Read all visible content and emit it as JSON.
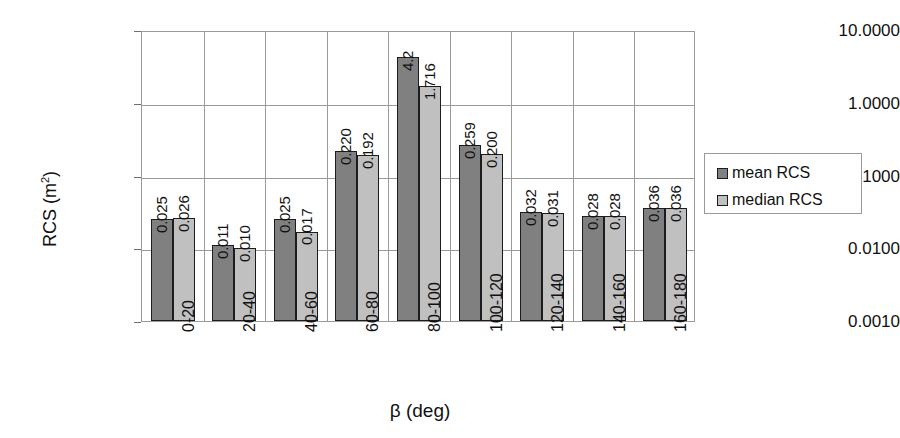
{
  "chart_data": {
    "type": "bar",
    "title": "",
    "xlabel": "β (deg)",
    "ylabel": "RCS (m²)",
    "ylabel_base": "RCS (m",
    "ylabel_sup": "2",
    "ylabel_close": ")",
    "yscale": "log",
    "ylim": [
      0.001,
      10
    ],
    "ytick_labels": [
      "10.0000",
      "1.0000",
      "0.1000",
      "0.0100",
      "0.0010"
    ],
    "ytick_values": [
      10,
      1,
      0.1,
      0.01,
      0.001
    ],
    "grid": true,
    "legend_position": "right",
    "categories": [
      "0-20",
      "20-40",
      "40-60",
      "60-80",
      "80-100",
      "100-120",
      "120-140",
      "140-160",
      "160-180"
    ],
    "series": [
      {
        "name": "mean RCS",
        "color": "#808080",
        "values": [
          0.025,
          0.011,
          0.025,
          0.22,
          4.2,
          0.259,
          0.032,
          0.028,
          0.036
        ],
        "labels": [
          "0.025",
          "0.011",
          "0.025",
          "0.220",
          "4.2",
          "0.259",
          "0.032",
          "0.028",
          "0.036"
        ]
      },
      {
        "name": "median RCS",
        "color": "#c0c0c0",
        "values": [
          0.026,
          0.01,
          0.017,
          0.192,
          1.716,
          0.2,
          0.031,
          0.028,
          0.036
        ],
        "labels": [
          "0.026",
          "0.010",
          "0.017",
          "0.192",
          "1.716",
          "0.200",
          "0.031",
          "0.028",
          "0.036"
        ]
      }
    ]
  },
  "legend": {
    "items": [
      {
        "label": "mean RCS",
        "swatch": "mean"
      },
      {
        "label": "median RCS",
        "swatch": "median"
      }
    ]
  }
}
